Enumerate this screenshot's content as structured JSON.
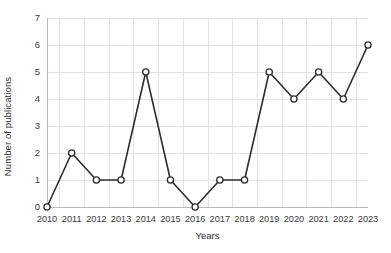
{
  "chart_data": {
    "type": "line",
    "title": "",
    "xlabel": "Years",
    "ylabel": "Number of publications",
    "categories": [
      "2010",
      "2011",
      "2012",
      "2013",
      "2014",
      "2015",
      "2016",
      "2017",
      "2018",
      "2019",
      "2020",
      "2021",
      "2022",
      "2023"
    ],
    "values": [
      0,
      2,
      1,
      1,
      5,
      1,
      0,
      1,
      1,
      5,
      4,
      5,
      4,
      6
    ],
    "series": [
      {
        "name": "Number of publications",
        "values": [
          0,
          2,
          1,
          1,
          5,
          1,
          0,
          1,
          1,
          5,
          4,
          5,
          4,
          6
        ]
      }
    ],
    "ylim": [
      0,
      7
    ],
    "yticks": [
      0,
      1,
      2,
      3,
      4,
      5,
      6,
      7
    ],
    "ytick_labels": [
      "0",
      "1",
      "2",
      "3",
      "4",
      "5",
      "6",
      "7"
    ],
    "xtick_labels": [
      "2010",
      "2011",
      "2012",
      "2013",
      "2014",
      "2015",
      "2016",
      "2017",
      "2018",
      "2019",
      "2020",
      "2021",
      "2022",
      "2023"
    ],
    "grid": true,
    "grid_color": "#e2e2e4",
    "legend": false,
    "legend_position": "none",
    "line_color": "#2e2e2e",
    "marker_style": "open-circle",
    "marker_fill": "#ffffff",
    "background_color": "#ffffff"
  }
}
